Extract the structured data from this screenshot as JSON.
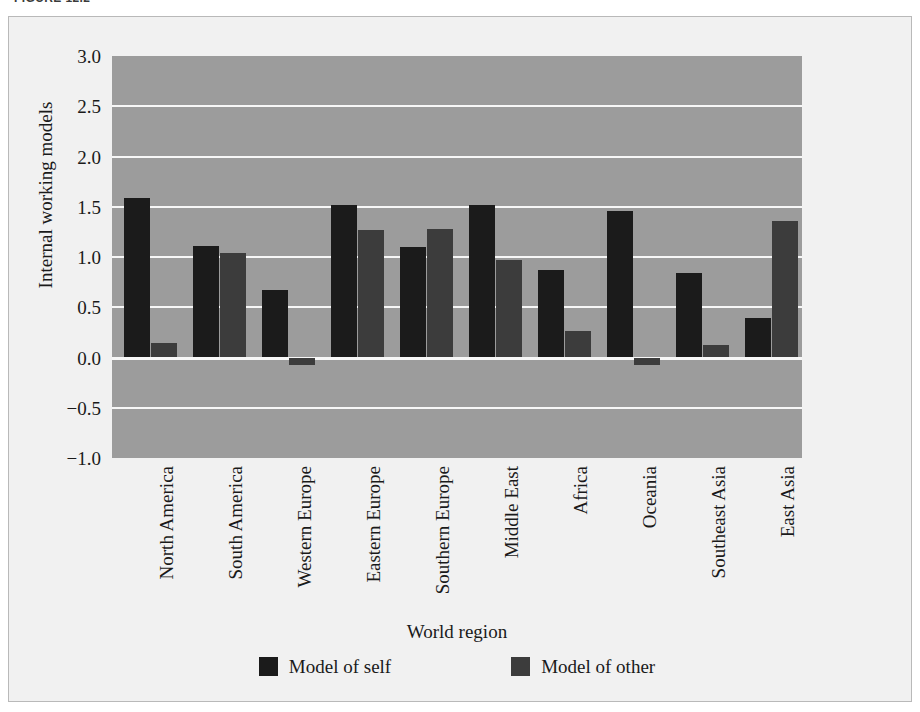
{
  "figure": {
    "caption": "FIGURE 12.2"
  },
  "chart_data": {
    "type": "bar",
    "title": "",
    "xlabel": "World region",
    "ylabel": "Internal working models",
    "ylim": [
      -1.0,
      3.0
    ],
    "yticks": [
      "3.0",
      "2.5",
      "2.0",
      "1.5",
      "1.0",
      "0.5",
      "0.0",
      "-0.5",
      "-1.0"
    ],
    "ytick_values": [
      3.0,
      2.5,
      2.0,
      1.5,
      1.0,
      0.5,
      0.0,
      -0.5,
      -1.0
    ],
    "grid": true,
    "legend_position": "bottom",
    "categories": [
      "North America",
      "South America",
      "Western Europe",
      "Eastern Europe",
      "Southern Europe",
      "Middle East",
      "Africa",
      "Oceania",
      "Southeast Asia",
      "East Asia"
    ],
    "series": [
      {
        "name": "Model of self",
        "color": "#1b1b1b",
        "values": [
          1.59,
          1.11,
          0.67,
          1.52,
          1.1,
          1.52,
          0.87,
          1.46,
          0.84,
          0.39
        ]
      },
      {
        "name": "Model of other",
        "color": "#3c3c3c",
        "values": [
          0.14,
          1.04,
          -0.07,
          1.27,
          1.28,
          0.97,
          0.26,
          -0.07,
          0.12,
          1.36
        ]
      }
    ],
    "plot_background_color": "#9c9c9c",
    "gridline_color": "#f7f7f7",
    "figure_background_color": "#f1f1f1"
  }
}
